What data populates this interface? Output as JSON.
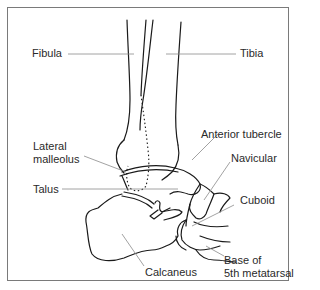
{
  "diagram": {
    "type": "anatomical-line-drawing",
    "colors": {
      "line": "#1a1a1a",
      "leader": "#8a8a8a",
      "frame": "#7a7a7a",
      "background": "#ffffff"
    },
    "labels": {
      "fibula": "Fibula",
      "tibia": "Tibia",
      "lateral_malleolus_1": "Lateral",
      "lateral_malleolus_2": "malleolus",
      "anterior_tubercle": "Anterior tubercle",
      "navicular": "Navicular",
      "talus": "Talus",
      "cuboid": "Cuboid",
      "calcaneus": "Calcaneus",
      "base_5th_metatarsal_1": "Base of",
      "base_5th_metatarsal_2": "5th metatarsal"
    }
  }
}
